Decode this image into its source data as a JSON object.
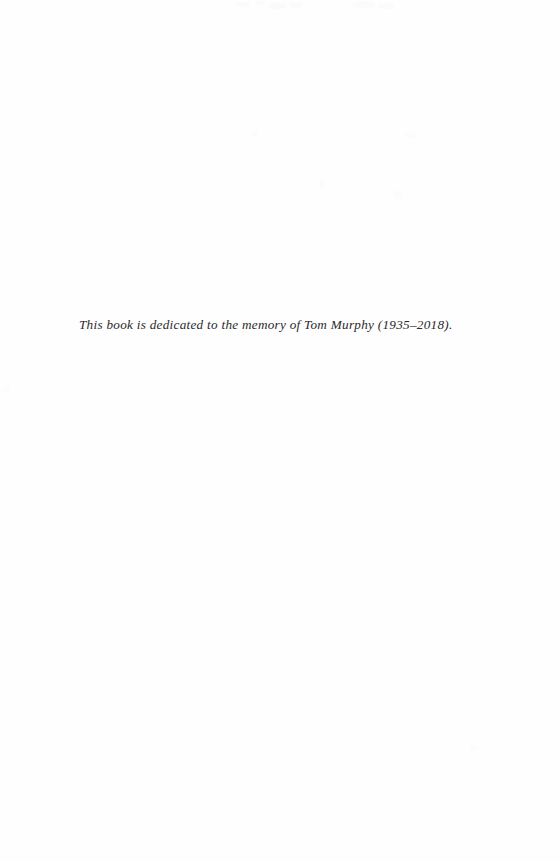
{
  "page": {
    "kind": "book-dedication-page",
    "background_color": "#fefefe",
    "width": 560,
    "height": 861
  },
  "dedication": {
    "text": "This book is dedicated to the memory of Tom Murphy (1935–2018).",
    "color": "#2a2a2a",
    "style": "italic-serif"
  },
  "artifacts": {
    "description": "faint scanner speckles / bleed-through near top edge",
    "color": "#fafafa"
  }
}
